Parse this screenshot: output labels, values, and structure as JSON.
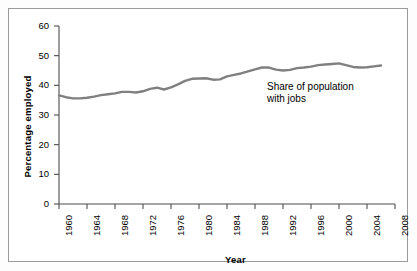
{
  "chart_data": {
    "type": "line",
    "title": "",
    "xlabel": "Year",
    "ylabel": "Percentage employed",
    "xlim": [
      1960,
      2008
    ],
    "ylim": [
      0,
      60
    ],
    "grid": false,
    "legend_position": "none",
    "annotations": [
      {
        "text": "Share of population\nwith jobs",
        "x": 1993,
        "y": 42
      }
    ],
    "xticks": [
      1960,
      1964,
      1968,
      1972,
      1976,
      1980,
      1984,
      1988,
      1992,
      1996,
      2000,
      2004,
      2008
    ],
    "xtick_labels": [
      "1960",
      "1964",
      "1968",
      "1972",
      "1976",
      "1980",
      "1984",
      "1988",
      "1992",
      "1996",
      "2000",
      "2004",
      "2008"
    ],
    "yticks": [
      0,
      10,
      20,
      30,
      40,
      50,
      60
    ],
    "ytick_labels": [
      "0",
      "10",
      "20",
      "30",
      "40",
      "50",
      "60"
    ],
    "series": [
      {
        "name": "Share of population with jobs",
        "color": "#808080",
        "x": [
          1960,
          1961,
          1962,
          1963,
          1964,
          1965,
          1966,
          1967,
          1968,
          1969,
          1970,
          1971,
          1972,
          1973,
          1974,
          1975,
          1976,
          1977,
          1978,
          1979,
          1980,
          1981,
          1982,
          1983,
          1984,
          1985,
          1986,
          1987,
          1988,
          1989,
          1990,
          1991,
          1992,
          1993,
          1994,
          1995,
          1996,
          1997,
          1998,
          1999,
          2000,
          2001,
          2002,
          2003,
          2004,
          2005,
          2006
        ],
        "values": [
          36.6,
          36.0,
          35.6,
          35.6,
          35.8,
          36.2,
          36.7,
          37.0,
          37.3,
          37.8,
          37.8,
          37.6,
          38.0,
          38.8,
          39.2,
          38.6,
          39.3,
          40.3,
          41.5,
          42.2,
          42.3,
          42.4,
          41.9,
          42.0,
          43.0,
          43.5,
          44.0,
          44.7,
          45.4,
          46.0,
          46.0,
          45.3,
          45.0,
          45.2,
          45.8,
          46.0,
          46.3,
          46.8,
          47.0,
          47.2,
          47.4,
          46.8,
          46.2,
          46.0,
          46.1,
          46.4,
          46.7
        ],
        "notes": "Employment-to-population ratio, percent"
      }
    ]
  },
  "figure": {
    "background_color": "#ffffff",
    "frame_color": "#9a9a9a",
    "axis_color": "#4d4d4d",
    "line_color": "#808080",
    "line_width": 2.4
  }
}
